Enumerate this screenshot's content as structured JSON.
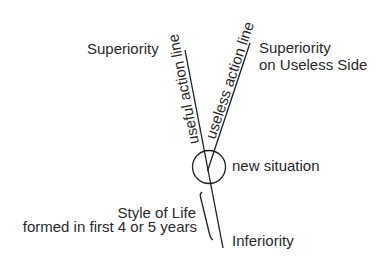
{
  "diagram": {
    "labels": {
      "superiority": "Superiority",
      "superiority_useless_line1": "Superiority",
      "superiority_useless_line2": "on Useless Side",
      "useful_action_line": "useful action line",
      "useless_action_line": "useless action line",
      "new_situation": "new situation",
      "style_of_life_line1": "Style of Life",
      "style_of_life_line2": "formed in first 4 or 5 years",
      "inferiority": "Inferiority"
    },
    "colors": {
      "line": "#1e1e1e",
      "text": "#2a2a2a",
      "background": "#ffffff"
    }
  }
}
